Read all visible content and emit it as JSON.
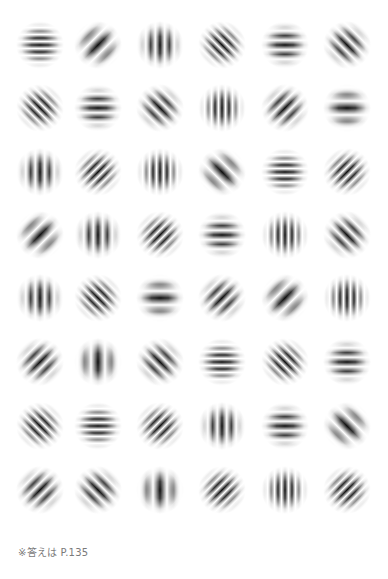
{
  "caption": "※答えは P.135",
  "grid": {
    "columns": 6,
    "rows": 8,
    "col_centers": [
      40,
      98,
      160,
      222,
      285,
      347
    ],
    "row_centers": [
      45,
      108,
      172,
      235,
      298,
      362,
      426,
      490
    ],
    "ink_color": "#000000",
    "background_color": "#ffffff"
  },
  "patches": [
    [
      {
        "angle": 0,
        "freq": "high"
      },
      {
        "angle": 45,
        "freq": "low"
      },
      {
        "angle": 90,
        "freq": "med"
      },
      {
        "angle": 135,
        "freq": "high"
      },
      {
        "angle": 0,
        "freq": "med"
      },
      {
        "angle": 135,
        "freq": "med"
      }
    ],
    [
      {
        "angle": 135,
        "freq": "high"
      },
      {
        "angle": 0,
        "freq": "med"
      },
      {
        "angle": 135,
        "freq": "med"
      },
      {
        "angle": 90,
        "freq": "high"
      },
      {
        "angle": 45,
        "freq": "med"
      },
      {
        "angle": 0,
        "freq": "low"
      }
    ],
    [
      {
        "angle": 90,
        "freq": "med"
      },
      {
        "angle": 45,
        "freq": "high"
      },
      {
        "angle": 90,
        "freq": "high"
      },
      {
        "angle": 135,
        "freq": "low"
      },
      {
        "angle": 0,
        "freq": "high"
      },
      {
        "angle": 45,
        "freq": "high"
      }
    ],
    [
      {
        "angle": 45,
        "freq": "low"
      },
      {
        "angle": 90,
        "freq": "med"
      },
      {
        "angle": 45,
        "freq": "high"
      },
      {
        "angle": 0,
        "freq": "med"
      },
      {
        "angle": 90,
        "freq": "high"
      },
      {
        "angle": 135,
        "freq": "med"
      }
    ],
    [
      {
        "angle": 90,
        "freq": "med"
      },
      {
        "angle": 135,
        "freq": "high"
      },
      {
        "angle": 0,
        "freq": "low"
      },
      {
        "angle": 45,
        "freq": "med"
      },
      {
        "angle": 45,
        "freq": "low"
      },
      {
        "angle": 90,
        "freq": "high"
      }
    ],
    [
      {
        "angle": 45,
        "freq": "med"
      },
      {
        "angle": 90,
        "freq": "low"
      },
      {
        "angle": 135,
        "freq": "med"
      },
      {
        "angle": 0,
        "freq": "high"
      },
      {
        "angle": 135,
        "freq": "high"
      },
      {
        "angle": 0,
        "freq": "med"
      }
    ],
    [
      {
        "angle": 135,
        "freq": "high"
      },
      {
        "angle": 0,
        "freq": "high"
      },
      {
        "angle": 45,
        "freq": "high"
      },
      {
        "angle": 90,
        "freq": "med"
      },
      {
        "angle": 0,
        "freq": "med"
      },
      {
        "angle": 135,
        "freq": "low"
      }
    ],
    [
      {
        "angle": 45,
        "freq": "med"
      },
      {
        "angle": 135,
        "freq": "med"
      },
      {
        "angle": 90,
        "freq": "low"
      },
      {
        "angle": 45,
        "freq": "high"
      },
      {
        "angle": 90,
        "freq": "high"
      },
      {
        "angle": 45,
        "freq": "high"
      }
    ]
  ]
}
